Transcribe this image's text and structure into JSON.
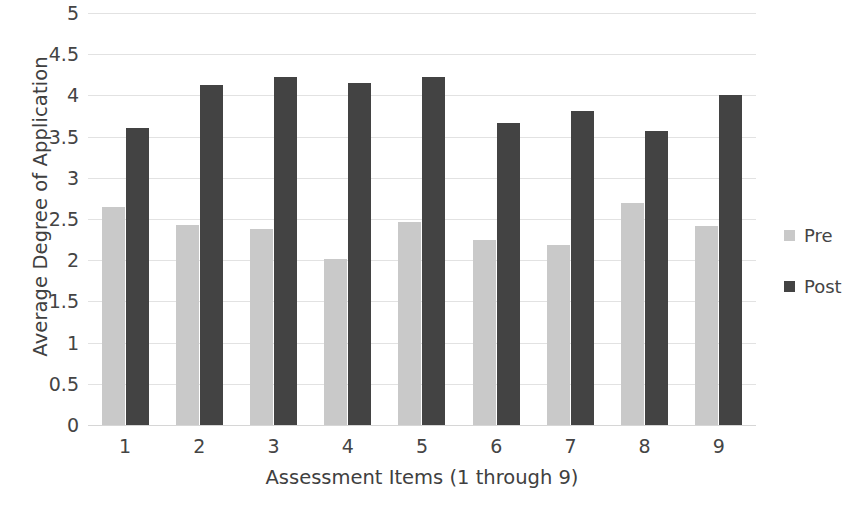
{
  "chart_data": {
    "type": "bar",
    "title": "",
    "xlabel": "Assessment Items (1 through 9)",
    "ylabel": "Average Degree of Application",
    "categories": [
      "1",
      "2",
      "3",
      "4",
      "5",
      "6",
      "7",
      "8",
      "9"
    ],
    "series": [
      {
        "name": "Pre",
        "color": "#c9c9c9",
        "values": [
          2.65,
          2.43,
          2.38,
          2.02,
          2.46,
          2.24,
          2.18,
          2.7,
          2.42
        ]
      },
      {
        "name": "Post",
        "color": "#434343",
        "values": [
          3.6,
          4.13,
          4.22,
          4.15,
          4.22,
          3.66,
          3.81,
          3.57,
          4.01
        ]
      }
    ],
    "ylim": [
      0,
      5
    ],
    "yticks": [
      "0",
      "0.5",
      "1",
      "1.5",
      "2",
      "2.5",
      "3",
      "3.5",
      "4",
      "4.5",
      "5"
    ],
    "ytick_values": [
      0,
      0.5,
      1,
      1.5,
      2,
      2.5,
      3,
      3.5,
      4,
      4.5,
      5
    ],
    "grid": true,
    "legend_position": "right",
    "background_color": "#ffffff",
    "gridline_color": "#e2e2e2"
  }
}
